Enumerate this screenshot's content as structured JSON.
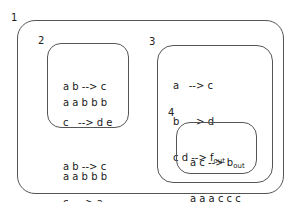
{
  "membranes": [
    {
      "id": "1",
      "label": "1"
    },
    {
      "id": "2",
      "label": "2",
      "rules": [
        {
          "lhs": "a b",
          "arrow": "-->",
          "rhs": "c",
          "sub": ""
        },
        {
          "lhs": "c",
          "arrow": "-->",
          "rhs": "d e",
          "sub": ""
        }
      ],
      "multiset": "a a b b b"
    },
    {
      "id": "1-contents",
      "rules": [
        {
          "lhs": "a b",
          "arrow": "-->",
          "rhs": "c",
          "sub": ""
        },
        {
          "lhs": "c",
          "arrow": "-->",
          "rhs": "a",
          "sub": "in3"
        }
      ],
      "multiset": "a a b b b"
    },
    {
      "id": "3",
      "label": "3",
      "rules": [
        {
          "lhs": "a",
          "arrow": "-->",
          "rhs": "c",
          "sub": ""
        },
        {
          "lhs": "b",
          "arrow": "-->",
          "rhs": "d",
          "sub": ""
        },
        {
          "lhs": "c d",
          "arrow": "-->",
          "rhs": "f",
          "sub": "out"
        }
      ]
    },
    {
      "id": "4",
      "label": "4",
      "rules": [
        {
          "lhs": "a c",
          "arrow": "-->",
          "rhs": "b",
          "sub": "out"
        }
      ],
      "multiset": "a a a c c c"
    }
  ]
}
